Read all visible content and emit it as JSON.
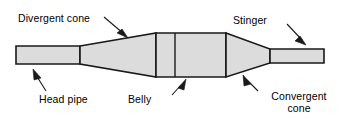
{
  "diagram": {
    "colors": {
      "body_fill": "#dcdcdc",
      "outline": "#1a1a1a",
      "text": "#000000",
      "background": "#ffffff"
    },
    "labels": {
      "divergent_cone": "Divergent cone",
      "stinger": "Stinger",
      "head_pipe": "Head pipe",
      "belly": "Belly",
      "convergent_cone_line1": "Convergent",
      "convergent_cone_line2": "cone"
    },
    "parts": [
      {
        "name": "head-pipe",
        "shape": "rectangle"
      },
      {
        "name": "divergent-cone",
        "shape": "trapezoid"
      },
      {
        "name": "belly",
        "shape": "rectangle"
      },
      {
        "name": "convergent-cone",
        "shape": "trapezoid"
      },
      {
        "name": "stinger",
        "shape": "rectangle"
      }
    ]
  }
}
